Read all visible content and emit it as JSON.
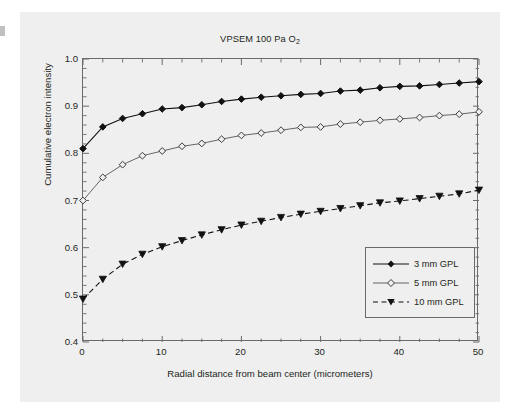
{
  "figure": {
    "title_main": "VPSEM 100 Pa O",
    "title_sub": "2",
    "background": "#efefef",
    "axis_color": "#6a6a6a",
    "text_color": "#231f20"
  },
  "axes": {
    "x_label": "Radial distance from beam center (micrometers)",
    "y_label": "Cumulative electron intensity",
    "x_ticks": [
      "0",
      "10",
      "20",
      "30",
      "40",
      "50"
    ],
    "y_ticks": [
      "1.0",
      "0.9",
      "0.8",
      "0.7",
      "0.6",
      "0.5",
      "0.4"
    ]
  },
  "legend": {
    "items": [
      {
        "label": "3 mm GPL",
        "marker": "filled-diamond",
        "line": "solid",
        "color": "#111111"
      },
      {
        "label": "5 mm GPL",
        "marker": "open-diamond",
        "line": "solid",
        "color": "#555555"
      },
      {
        "label": "10 mm GPL",
        "marker": "filled-triangle-down",
        "line": "dashed",
        "color": "#111111"
      }
    ]
  },
  "chart_data": {
    "type": "line",
    "title": "VPSEM 100 Pa O2",
    "xlabel": "Radial distance from beam center (micrometers)",
    "ylabel": "Cumulative electron intensity",
    "xlim": [
      0,
      50
    ],
    "ylim": [
      0.4,
      1.0
    ],
    "x_major_tick": 10,
    "x_minor_tick": 2.5,
    "y_major_tick": 0.1,
    "y_minor_tick": 0.02,
    "grid": false,
    "legend_position": "lower right",
    "x": [
      0,
      2.5,
      5,
      7.5,
      10,
      12.5,
      15,
      17.5,
      20,
      22.5,
      25,
      27.5,
      30,
      32.5,
      35,
      37.5,
      40,
      42.5,
      45,
      47.5,
      50
    ],
    "series": [
      {
        "name": "3 mm GPL",
        "marker": "filled-diamond",
        "line": "solid",
        "color": "#111111",
        "values": [
          0.81,
          0.856,
          0.874,
          0.884,
          0.894,
          0.897,
          0.903,
          0.91,
          0.915,
          0.919,
          0.922,
          0.925,
          0.927,
          0.932,
          0.934,
          0.939,
          0.942,
          0.943,
          0.946,
          0.949,
          0.952
        ]
      },
      {
        "name": "5 mm GPL",
        "marker": "open-diamond",
        "line": "solid",
        "color": "#555555",
        "values": [
          0.7,
          0.749,
          0.776,
          0.795,
          0.805,
          0.815,
          0.821,
          0.83,
          0.838,
          0.843,
          0.849,
          0.855,
          0.856,
          0.862,
          0.866,
          0.87,
          0.873,
          0.876,
          0.88,
          0.883,
          0.888
        ]
      },
      {
        "name": "10 mm GPL",
        "marker": "filled-triangle-down",
        "line": "dashed",
        "color": "#111111",
        "values": [
          0.491,
          0.533,
          0.565,
          0.586,
          0.602,
          0.615,
          0.627,
          0.638,
          0.648,
          0.656,
          0.664,
          0.671,
          0.677,
          0.683,
          0.689,
          0.695,
          0.699,
          0.704,
          0.709,
          0.714,
          0.722
        ]
      }
    ]
  }
}
